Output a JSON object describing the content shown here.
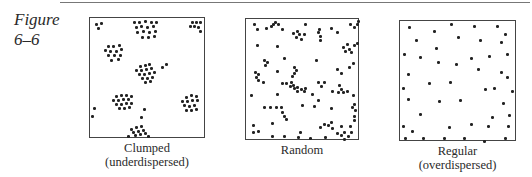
{
  "figure": {
    "label_line1": "Figure",
    "label_line2": "6–6"
  },
  "panels": [
    {
      "caption_line1": "Clumped",
      "caption_line2": "(underdispersed)",
      "box": {
        "left": 89,
        "top": 17,
        "width": 116,
        "height": 121
      },
      "dots": [
        [
          6,
          6
        ],
        [
          11,
          5
        ],
        [
          8,
          10
        ],
        [
          44,
          4
        ],
        [
          49,
          4
        ],
        [
          55,
          3
        ],
        [
          61,
          4
        ],
        [
          66,
          4
        ],
        [
          46,
          9
        ],
        [
          51,
          8
        ],
        [
          57,
          9
        ],
        [
          63,
          8
        ],
        [
          47,
          14
        ],
        [
          53,
          13
        ],
        [
          59,
          14
        ],
        [
          65,
          13
        ],
        [
          52,
          19
        ],
        [
          58,
          19
        ],
        [
          64,
          18
        ],
        [
          102,
          4
        ],
        [
          106,
          4
        ],
        [
          110,
          4
        ],
        [
          100,
          8
        ],
        [
          104,
          8
        ],
        [
          108,
          9
        ],
        [
          110,
          13
        ],
        [
          18,
          28
        ],
        [
          23,
          28
        ],
        [
          29,
          27
        ],
        [
          15,
          32
        ],
        [
          20,
          33
        ],
        [
          26,
          33
        ],
        [
          31,
          31
        ],
        [
          18,
          37
        ],
        [
          24,
          37
        ],
        [
          30,
          37
        ],
        [
          21,
          42
        ],
        [
          28,
          41
        ],
        [
          50,
          48
        ],
        [
          55,
          47
        ],
        [
          59,
          46
        ],
        [
          46,
          52
        ],
        [
          51,
          52
        ],
        [
          56,
          51
        ],
        [
          61,
          50
        ],
        [
          49,
          56
        ],
        [
          54,
          56
        ],
        [
          59,
          55
        ],
        [
          64,
          54
        ],
        [
          52,
          60
        ],
        [
          57,
          60
        ],
        [
          62,
          59
        ],
        [
          55,
          64
        ],
        [
          60,
          63
        ],
        [
          72,
          49
        ],
        [
          76,
          46
        ],
        [
          26,
          78
        ],
        [
          31,
          77
        ],
        [
          36,
          77
        ],
        [
          41,
          78
        ],
        [
          23,
          82
        ],
        [
          28,
          82
        ],
        [
          33,
          81
        ],
        [
          38,
          81
        ],
        [
          26,
          86
        ],
        [
          31,
          86
        ],
        [
          36,
          85
        ],
        [
          41,
          85
        ],
        [
          29,
          90
        ],
        [
          34,
          90
        ],
        [
          39,
          89
        ],
        [
          96,
          79
        ],
        [
          101,
          77
        ],
        [
          106,
          78
        ],
        [
          92,
          83
        ],
        [
          97,
          83
        ],
        [
          102,
          82
        ],
        [
          107,
          82
        ],
        [
          94,
          87
        ],
        [
          99,
          88
        ],
        [
          104,
          87
        ],
        [
          96,
          92
        ],
        [
          101,
          92
        ],
        [
          106,
          91
        ],
        [
          4,
          90
        ],
        [
          2,
          98
        ],
        [
          54,
          91
        ],
        [
          51,
          99
        ],
        [
          41,
          111
        ],
        [
          46,
          109
        ],
        [
          51,
          108
        ],
        [
          43,
          114
        ],
        [
          48,
          113
        ],
        [
          53,
          112
        ],
        [
          45,
          117
        ],
        [
          50,
          116
        ],
        [
          55,
          115
        ],
        [
          38,
          118
        ],
        [
          58,
          118
        ]
      ]
    },
    {
      "caption_line1": "Random",
      "caption_line2": "",
      "box": {
        "left": 245,
        "top": 18,
        "width": 114,
        "height": 122
      },
      "dots": [
        [
          8,
          5
        ],
        [
          11,
          10
        ],
        [
          20,
          9
        ],
        [
          25,
          7
        ],
        [
          27,
          5
        ],
        [
          29,
          3
        ],
        [
          32,
          5
        ],
        [
          36,
          10
        ],
        [
          59,
          5
        ],
        [
          47,
          14
        ],
        [
          51,
          12
        ],
        [
          53,
          15
        ],
        [
          50,
          18
        ],
        [
          55,
          20
        ],
        [
          58,
          15
        ],
        [
          72,
          13
        ],
        [
          74,
          17
        ],
        [
          74,
          21
        ],
        [
          73,
          10
        ],
        [
          85,
          9
        ],
        [
          91,
          13
        ],
        [
          104,
          5
        ],
        [
          108,
          8
        ],
        [
          111,
          5
        ],
        [
          112,
          2
        ],
        [
          11,
          26
        ],
        [
          31,
          27
        ],
        [
          97,
          28
        ],
        [
          99,
          32
        ],
        [
          101,
          25
        ],
        [
          103,
          30
        ],
        [
          105,
          33
        ],
        [
          108,
          26
        ],
        [
          111,
          24
        ],
        [
          18,
          41
        ],
        [
          21,
          43
        ],
        [
          19,
          46
        ],
        [
          38,
          39
        ],
        [
          70,
          41
        ],
        [
          107,
          44
        ],
        [
          103,
          48
        ],
        [
          9,
          53
        ],
        [
          12,
          55
        ],
        [
          10,
          58
        ],
        [
          12,
          61
        ],
        [
          17,
          63
        ],
        [
          31,
          52
        ],
        [
          48,
          48
        ],
        [
          50,
          51
        ],
        [
          48,
          54
        ],
        [
          46,
          57
        ],
        [
          91,
          50
        ],
        [
          95,
          54
        ],
        [
          36,
          64
        ],
        [
          40,
          64
        ],
        [
          45,
          63
        ],
        [
          44,
          67
        ],
        [
          47,
          66
        ],
        [
          48,
          69
        ],
        [
          51,
          68
        ],
        [
          51,
          72
        ],
        [
          55,
          70
        ],
        [
          59,
          69
        ],
        [
          72,
          63
        ],
        [
          78,
          63
        ],
        [
          75,
          67
        ],
        [
          93,
          66
        ],
        [
          95,
          70
        ],
        [
          92,
          73
        ],
        [
          97,
          73
        ],
        [
          101,
          72
        ],
        [
          86,
          72
        ],
        [
          107,
          76
        ],
        [
          72,
          81
        ],
        [
          5,
          76
        ],
        [
          31,
          75
        ],
        [
          58,
          72
        ],
        [
          66,
          75
        ],
        [
          18,
          88
        ],
        [
          24,
          88
        ],
        [
          30,
          88
        ],
        [
          35,
          88
        ],
        [
          36,
          93
        ],
        [
          38,
          97
        ],
        [
          40,
          100
        ],
        [
          56,
          86
        ],
        [
          68,
          87
        ],
        [
          85,
          89
        ],
        [
          106,
          88
        ],
        [
          108,
          85
        ],
        [
          109,
          91
        ],
        [
          108,
          97
        ],
        [
          108,
          101
        ],
        [
          7,
          106
        ],
        [
          26,
          104
        ],
        [
          74,
          108
        ],
        [
          78,
          105
        ],
        [
          82,
          106
        ],
        [
          85,
          103
        ],
        [
          86,
          109
        ],
        [
          95,
          107
        ],
        [
          104,
          107
        ],
        [
          7,
          113
        ],
        [
          12,
          112
        ],
        [
          26,
          117
        ],
        [
          38,
          117
        ],
        [
          54,
          113
        ],
        [
          52,
          118
        ],
        [
          64,
          119
        ],
        [
          79,
          118
        ],
        [
          91,
          114
        ],
        [
          95,
          116
        ],
        [
          98,
          120
        ],
        [
          102,
          117
        ],
        [
          98,
          113
        ],
        [
          105,
          113
        ]
      ]
    },
    {
      "caption_line1": "Regular",
      "caption_line2": "(overdispersed)",
      "box": {
        "left": 399,
        "top": 20,
        "width": 117,
        "height": 121
      },
      "dots": [
        [
          9,
          6
        ],
        [
          51,
          3
        ],
        [
          74,
          5
        ],
        [
          97,
          5
        ],
        [
          34,
          10
        ],
        [
          16,
          19
        ],
        [
          58,
          16
        ],
        [
          80,
          19
        ],
        [
          105,
          13
        ],
        [
          101,
          21
        ],
        [
          4,
          33
        ],
        [
          20,
          36
        ],
        [
          36,
          27
        ],
        [
          56,
          43
        ],
        [
          89,
          35
        ],
        [
          71,
          37
        ],
        [
          107,
          33
        ],
        [
          38,
          41
        ],
        [
          8,
          53
        ],
        [
          78,
          48
        ],
        [
          101,
          51
        ],
        [
          29,
          62
        ],
        [
          107,
          56
        ],
        [
          50,
          61
        ],
        [
          3,
          67
        ],
        [
          60,
          79
        ],
        [
          85,
          68
        ],
        [
          94,
          67
        ],
        [
          112,
          70
        ],
        [
          39,
          80
        ],
        [
          8,
          78
        ],
        [
          103,
          82
        ],
        [
          20,
          93
        ],
        [
          92,
          96
        ],
        [
          109,
          94
        ],
        [
          3,
          105
        ],
        [
          71,
          103
        ],
        [
          49,
          106
        ],
        [
          12,
          110
        ],
        [
          88,
          105
        ],
        [
          108,
          105
        ],
        [
          5,
          117
        ],
        [
          23,
          117
        ],
        [
          44,
          117
        ],
        [
          64,
          117
        ],
        [
          84,
          120
        ],
        [
          105,
          117
        ]
      ]
    }
  ]
}
